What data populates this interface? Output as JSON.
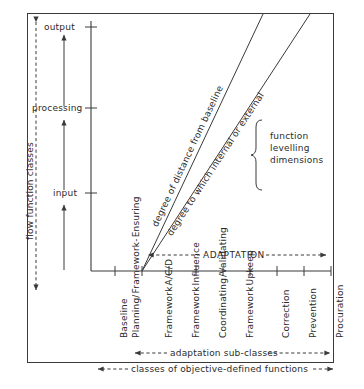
{
  "diagram": {
    "background": "#ffffff",
    "ink": "#3a3a3a"
  },
  "y_axis": {
    "name": "flow function classes",
    "side_label": "flow function classes",
    "ticks": [
      {
        "label": "output",
        "y": 27
      },
      {
        "label": "processing",
        "y": 108
      },
      {
        "label": "input",
        "y": 193
      }
    ],
    "flow_arrows": 2
  },
  "x_axis": {
    "group_label": "ADAPTATION",
    "categories": [
      {
        "label": "Baseline",
        "lines": [
          "Baseline"
        ]
      },
      {
        "label": "Planning/ Framework- Ensuring",
        "lines": [
          "Planning/",
          "Framework-",
          "Ensuring"
        ]
      },
      {
        "label": "Framework A/C/D",
        "lines": [
          "Framework",
          "A/C/D"
        ]
      },
      {
        "label": "Framework Influence",
        "lines": [
          "Framework",
          "Influence"
        ]
      },
      {
        "label": "Coordinating /Validating",
        "lines": [
          "Coordinating",
          "/Validating"
        ]
      },
      {
        "label": "Framework Upkeep",
        "lines": [
          "Framework",
          "Upkeep"
        ]
      },
      {
        "label": "Correction",
        "lines": [
          "Correction"
        ]
      },
      {
        "label": "Prevention",
        "lines": [
          "Prevention"
        ]
      },
      {
        "label": "Procuration",
        "lines": [
          "Procuration"
        ]
      }
    ],
    "span_labels": [
      {
        "text": "adaptation sub-classes"
      },
      {
        "text": "classes of objective-defined functions"
      }
    ]
  },
  "diagonals": [
    {
      "id": "upper",
      "label": "degree of distance from baseline"
    },
    {
      "id": "lower",
      "label": "degree to which internal or external"
    }
  ],
  "brace": {
    "lines": [
      "function",
      "levelling",
      "dimensions"
    ],
    "text": "function levelling dimensions"
  }
}
